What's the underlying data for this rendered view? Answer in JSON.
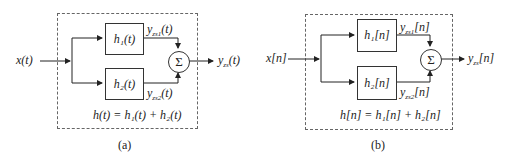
{
  "panels": [
    {
      "caption": "(a)",
      "input": "x(t)",
      "block1": "h₁(t)",
      "block2": "h₂(t)",
      "branch1_output": "y_zs1(t)",
      "branch2_output": "y_zs2(t)",
      "sum_symbol": "Σ",
      "output": "y_zs(t)",
      "equation": "h(t) = h₁(t) + h₂(t)"
    },
    {
      "caption": "(b)",
      "input": "x[n]",
      "block1": "h₁[n]",
      "block2": "h₂[n]",
      "branch1_output": "y_zs1[n]",
      "branch2_output": "y_zs2[n]",
      "sum_symbol": "Σ",
      "output": "y_zs[n]",
      "equation": "h[n] = h₁[n] + h₂[n]"
    }
  ]
}
